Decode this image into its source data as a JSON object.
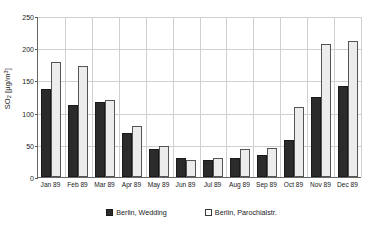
{
  "chart_data": {
    "type": "bar",
    "title": "",
    "subtitle": "",
    "xlabel": "",
    "ylabel": "SO2 [µg/m³]",
    "ylabel_parts": {
      "base": "SO",
      "subscript": "2",
      "unit_open": " [µg/m",
      "superscript": "3",
      "unit_close": "]"
    },
    "categories": [
      "Jan 89",
      "Feb 89",
      "Mar 89",
      "Apr 89",
      "May 89",
      "Jun 89",
      "Jul 89",
      "Aug 89",
      "Sep 89",
      "Oct 89",
      "Nov 89",
      "Dec 89"
    ],
    "series": [
      {
        "name": "Berlin, Wedding",
        "color": "#2b2b2b",
        "values": [
          136,
          112,
          117,
          68,
          43,
          30,
          26,
          29,
          34,
          58,
          124,
          142
        ]
      },
      {
        "name": "Berlin, Parochialstr.",
        "color": "#ececec",
        "values": [
          178,
          172,
          119,
          79,
          48,
          27,
          29,
          44,
          45,
          108,
          206,
          211
        ]
      }
    ],
    "ylim": [
      0,
      250
    ],
    "yticks": [
      0,
      50,
      100,
      150,
      200,
      250
    ],
    "ytick_labels": [
      "0",
      "50",
      "100",
      "150",
      "200",
      "250"
    ],
    "grid": {
      "horizontal": true,
      "vertical": true,
      "color": "#cfcfcf"
    },
    "legend": {
      "position": "bottom",
      "entries": [
        {
          "label": "Berlin, Wedding",
          "marker": "filled-square"
        },
        {
          "label": "Berlin, Parochialstr.",
          "marker": "open-square"
        }
      ]
    },
    "axes": {
      "left_line_color": "#666666",
      "bottom_line_color": "#666666"
    }
  }
}
